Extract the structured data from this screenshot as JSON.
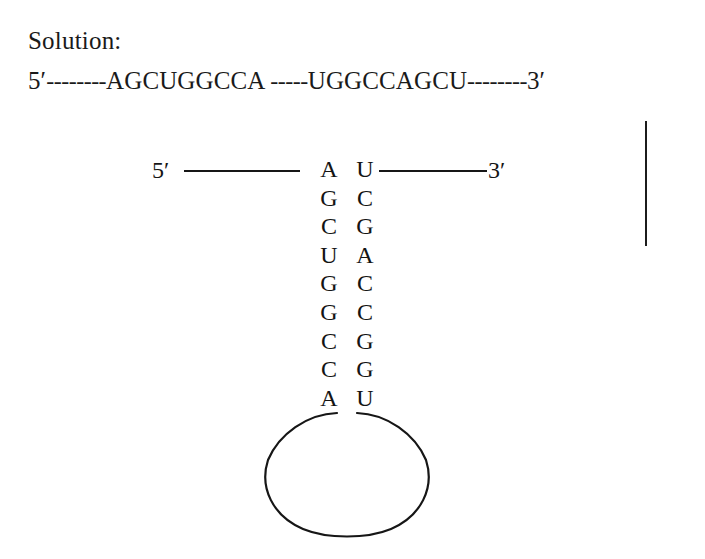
{
  "figure": {
    "heading": "Solution:",
    "linear_sequence": {
      "five_prime": "5′",
      "dashes_left": "--------",
      "segment_left": "AGCUGGCCA",
      "gap": " ",
      "dashes_middle": "-----",
      "segment_right": "UGGCCAGCU",
      "dashes_right": "--------",
      "three_prime": "3′",
      "full_text": "5′--------AGCUGGCCA -----UGGCCAGCU--------3′"
    },
    "hairpin": {
      "five_prime_label": "5′",
      "three_prime_label": "3′",
      "stem_pairs": [
        {
          "left": "A",
          "right": "U"
        },
        {
          "left": "G",
          "right": "C"
        },
        {
          "left": "C",
          "right": "G"
        },
        {
          "left": "U",
          "right": "A"
        },
        {
          "left": "G",
          "right": "C"
        },
        {
          "left": "G",
          "right": "C"
        },
        {
          "left": "C",
          "right": "G"
        },
        {
          "left": "C",
          "right": "G"
        },
        {
          "left": "A",
          "right": "U"
        }
      ],
      "loop": {
        "shape": "open-ellipse",
        "label": ""
      }
    },
    "margin_rule": {
      "label": ""
    },
    "colors": {
      "ink": "#161616",
      "background": "#ffffff"
    }
  }
}
